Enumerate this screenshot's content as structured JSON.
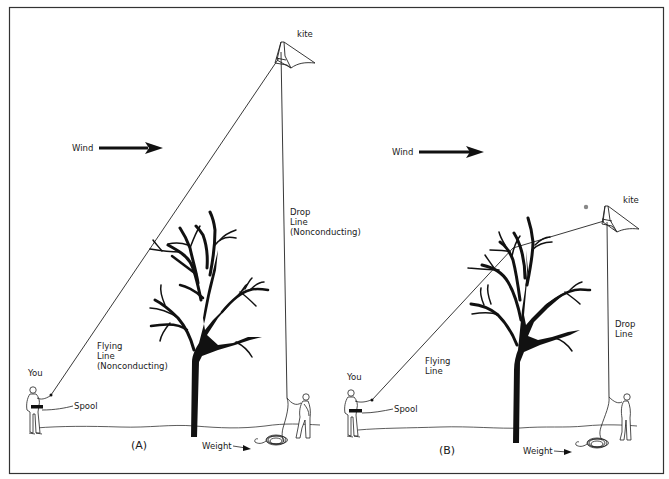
{
  "diagram": {
    "panel_a": {
      "caption": "(A)",
      "kite_label": "kite",
      "wind_label": "Wind",
      "you_label": "You",
      "spool_label": "Spool",
      "weight_label": "Weight",
      "flying_line_label": [
        "Flying",
        "Line",
        "(Nonconducting)"
      ],
      "drop_line_label": [
        "Drop",
        "Line",
        "(Nonconducting)"
      ]
    },
    "panel_b": {
      "caption": "(B)",
      "kite_label": "kite",
      "wind_label": "Wind",
      "you_label": "You",
      "spool_label": "Spool",
      "weight_label": "Weight",
      "flying_line_label": [
        "Flying",
        "Line"
      ],
      "drop_line_label": [
        "Drop",
        "Line"
      ]
    },
    "colors": {
      "ink": "#111111",
      "background": "#ffffff",
      "border": "#333333",
      "dot": "#888888"
    }
  }
}
